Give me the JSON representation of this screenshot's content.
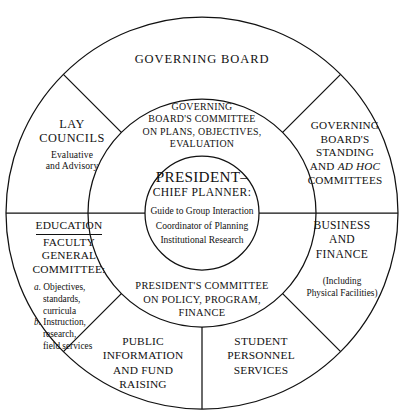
{
  "diagram": {
    "geometry": {
      "center_x": 202,
      "center_y": 213,
      "inner_radius": 57,
      "middle_radius": 114,
      "outer_radius": 196
    },
    "colors": {
      "background": "#ffffff",
      "stroke": "#111111",
      "text": "#111111"
    },
    "center": {
      "title_line1": "PRESIDENT–",
      "title_line2": "CHIEF PLANNER:",
      "roles": [
        "Guide to Group Interaction",
        "Coordinator of Planning",
        "Institutional Research"
      ]
    },
    "middle_ring": {
      "top": {
        "lines": [
          "GOVERNING",
          "BOARD'S COMMITTEE",
          "ON PLANS, OBJECTIVES,",
          "EVALUATION"
        ]
      },
      "bottom": {
        "lines": [
          "PRESIDENT'S COMMITTEE",
          "ON POLICY, PROGRAM,",
          "FINANCE"
        ]
      }
    },
    "outer_ring": {
      "governing_board": {
        "label": "GOVERNING BOARD"
      },
      "lay_councils": {
        "lines": [
          "LAY",
          "COUNCILS"
        ],
        "subtitle": [
          "Evaluative",
          "and Advisory"
        ]
      },
      "gb_standing": {
        "lines_pre": [
          "GOVERNING",
          "BOARD'S",
          "STANDING"
        ],
        "and_word": "AND ",
        "italic_word": "AD HOC",
        "last_line": "COMMITTEES"
      },
      "education": {
        "heading": "EDUCATION",
        "lines": [
          "FACULTY",
          "GENERAL",
          "COMMITTEE:"
        ],
        "items": [
          {
            "marker": "a.",
            "lines": [
              "Objectives,",
              "standards,",
              "curricula"
            ]
          },
          {
            "marker": "b.",
            "lines": [
              "Instruction,",
              "research,",
              "field services"
            ]
          }
        ]
      },
      "business_finance": {
        "lines": [
          "BUSINESS",
          "AND",
          "FINANCE"
        ],
        "subtitle": [
          "(Including",
          "Physical Facilities)"
        ]
      },
      "public_information": {
        "lines": [
          "PUBLIC",
          "INFORMATION",
          "AND  FUND",
          "RAISING"
        ]
      },
      "student_personnel": {
        "lines": [
          "STUDENT",
          "PERSONNEL",
          "SERVICES"
        ]
      }
    }
  }
}
